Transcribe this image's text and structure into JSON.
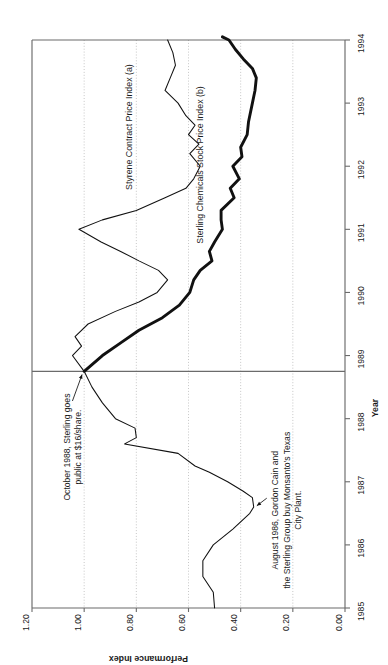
{
  "chart_data": {
    "type": "line",
    "title": "",
    "orientation": "rotated-90-ccw",
    "xlabel": "Year",
    "ylabel": "Performance Index",
    "xlim": [
      1985,
      1994
    ],
    "ylim": [
      0.0,
      1.2
    ],
    "xticks": [
      "1985",
      "1986",
      "1987",
      "1988",
      "1989",
      "1990",
      "1991",
      "1992",
      "1993",
      "1994"
    ],
    "yticks": [
      "0.00",
      "0.20",
      "0.40",
      "0.60",
      "0.80",
      "1.00",
      "1.20"
    ],
    "grid": "y-gridlines-dotted",
    "legend_position": "inline-labels",
    "series": [
      {
        "name": "Styrene Contract Price Index (a)",
        "style": "thin",
        "color": "#111111",
        "points": [
          [
            1985.0,
            0.5
          ],
          [
            1985.25,
            0.505
          ],
          [
            1985.5,
            0.545
          ],
          [
            1985.75,
            0.545
          ],
          [
            1986.0,
            0.505
          ],
          [
            1986.25,
            0.43
          ],
          [
            1986.5,
            0.365
          ],
          [
            1986.6,
            0.35
          ],
          [
            1986.75,
            0.355
          ],
          [
            1986.85,
            0.39
          ],
          [
            1987.0,
            0.45
          ],
          [
            1987.15,
            0.52
          ],
          [
            1987.25,
            0.575
          ],
          [
            1987.45,
            0.64
          ],
          [
            1987.6,
            0.845
          ],
          [
            1987.7,
            0.8
          ],
          [
            1987.85,
            0.805
          ],
          [
            1988.0,
            0.88
          ],
          [
            1988.25,
            0.93
          ],
          [
            1988.5,
            0.97
          ],
          [
            1988.75,
            1.0
          ],
          [
            1989.0,
            1.045
          ],
          [
            1989.15,
            1.01
          ],
          [
            1989.3,
            1.035
          ],
          [
            1989.5,
            0.985
          ],
          [
            1989.7,
            0.88
          ],
          [
            1989.85,
            0.79
          ],
          [
            1990.0,
            0.72
          ],
          [
            1990.2,
            0.68
          ],
          [
            1990.35,
            0.715
          ],
          [
            1990.5,
            0.79
          ],
          [
            1990.65,
            0.86
          ],
          [
            1990.8,
            0.935
          ],
          [
            1991.0,
            1.02
          ],
          [
            1991.15,
            0.93
          ],
          [
            1991.3,
            0.8
          ],
          [
            1991.5,
            0.69
          ],
          [
            1991.65,
            0.61
          ],
          [
            1991.8,
            0.58
          ],
          [
            1992.0,
            0.555
          ],
          [
            1992.2,
            0.595
          ],
          [
            1992.35,
            0.56
          ],
          [
            1992.5,
            0.6
          ],
          [
            1992.65,
            0.575
          ],
          [
            1992.8,
            0.61
          ],
          [
            1993.0,
            0.64
          ],
          [
            1993.2,
            0.69
          ],
          [
            1993.4,
            0.67
          ],
          [
            1993.6,
            0.65
          ],
          [
            1993.8,
            0.66
          ],
          [
            1994.0,
            0.68
          ]
        ]
      },
      {
        "name": "Sterling Chemicals Stock Price Index (b)",
        "style": "thick",
        "color": "#111111",
        "points": [
          [
            1988.75,
            1.0
          ],
          [
            1989.0,
            0.93
          ],
          [
            1989.2,
            0.86
          ],
          [
            1989.4,
            0.79
          ],
          [
            1989.6,
            0.7
          ],
          [
            1989.8,
            0.635
          ],
          [
            1990.0,
            0.595
          ],
          [
            1990.2,
            0.58
          ],
          [
            1990.35,
            0.555
          ],
          [
            1990.5,
            0.51
          ],
          [
            1990.65,
            0.52
          ],
          [
            1990.8,
            0.5
          ],
          [
            1991.0,
            0.47
          ],
          [
            1991.15,
            0.475
          ],
          [
            1991.3,
            0.475
          ],
          [
            1991.5,
            0.425
          ],
          [
            1991.65,
            0.44
          ],
          [
            1991.8,
            0.405
          ],
          [
            1992.0,
            0.43
          ],
          [
            1992.15,
            0.395
          ],
          [
            1992.3,
            0.4
          ],
          [
            1992.5,
            0.375
          ],
          [
            1992.7,
            0.37
          ],
          [
            1993.0,
            0.355
          ],
          [
            1993.2,
            0.345
          ],
          [
            1993.4,
            0.34
          ],
          [
            1993.55,
            0.355
          ],
          [
            1993.7,
            0.39
          ],
          [
            1993.85,
            0.42
          ],
          [
            1994.0,
            0.445
          ],
          [
            1994.05,
            0.47
          ]
        ]
      }
    ],
    "annotations": [
      {
        "id": "ipo",
        "text_lines": [
          "October 1988, Sterling goes",
          "public at $16/share."
        ],
        "target": [
          1988.75,
          1.0
        ]
      },
      {
        "id": "acquisition",
        "text_lines": [
          "August 1986, Gordon Cain and",
          "the Sterling Group buy Monsanto's Texas",
          "City Plant."
        ],
        "target": [
          1986.6,
          0.35
        ]
      }
    ],
    "series_labels": [
      {
        "text": "Styrene Contract Price Index (a)"
      },
      {
        "text": "Sterling Chemicals Stock Price Index (b)"
      }
    ],
    "divider_note": "vertical rule at 1988.75 separating pre-IPO period"
  }
}
